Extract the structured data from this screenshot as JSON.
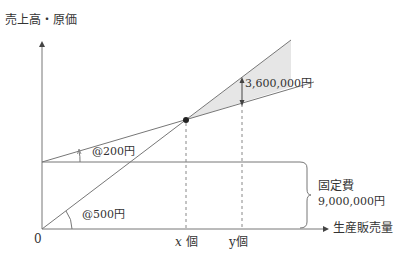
{
  "axes": {
    "y_label": "売上高・原価",
    "x_label": "生産販売量",
    "origin_label": "0"
  },
  "lines": {
    "sales": {
      "name": "sales-line",
      "slope_label": "@500円"
    },
    "total_cost": {
      "name": "total-cost-line",
      "slope_label": "@200円"
    },
    "fixed_cost": {
      "name": "fixed-cost-line"
    }
  },
  "annotations": {
    "fixed_cost_title": "固定費",
    "fixed_cost_value": "9,000,000円",
    "profit_gap": "3,600,000円",
    "x_marker_var": "x",
    "x_marker_unit": " 個",
    "y_marker": "y個"
  },
  "colors": {
    "line": "#666666",
    "shade": "#e6e6e6",
    "text": "#333333"
  }
}
